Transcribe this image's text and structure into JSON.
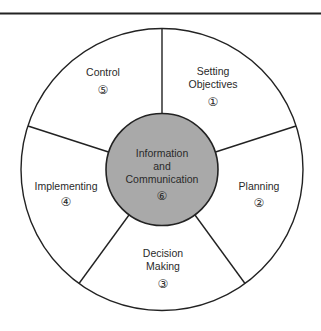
{
  "diagram": {
    "type": "wheel",
    "center": {
      "lines": [
        "Information",
        "and",
        "Communication"
      ],
      "number": "⑥",
      "fill": "#a9a9a9"
    },
    "segments": [
      {
        "lines": [
          "Setting",
          "Objectives"
        ],
        "number": "①"
      },
      {
        "lines": [
          "Planning"
        ],
        "number": "②"
      },
      {
        "lines": [
          "Decision",
          "Making"
        ],
        "number": "③"
      },
      {
        "lines": [
          "Implementing"
        ],
        "number": "④"
      },
      {
        "lines": [
          "Control"
        ],
        "number": "⑤"
      }
    ],
    "colors": {
      "stroke": "#222222",
      "background": "#ffffff",
      "center_fill": "#a9a9a9"
    }
  }
}
